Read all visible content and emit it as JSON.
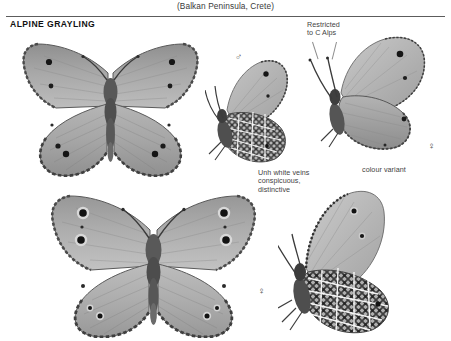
{
  "page": {
    "running_head": "(Balkan Peninsula, Crete)",
    "species_title": "ALPINE GRAYLING"
  },
  "annotations": [
    {
      "id": "restricted",
      "text": "Restricted\nto C Alps"
    },
    {
      "id": "unh_veins",
      "text": "Unh white veins\nconspicuous,\ndistinctive"
    },
    {
      "id": "colour_variant",
      "text": "colour variant"
    }
  ],
  "annotation_lines": {
    "restricted": [
      "Restricted",
      "to C Alps"
    ],
    "unh_veins": [
      "Unh white veins",
      "conspicuous,",
      "distinctive"
    ],
    "colour_variant": [
      "colour variant"
    ]
  },
  "symbols": {
    "male": "♂",
    "female_variant": "♀",
    "female_bottom": "♀"
  },
  "specimens": [
    {
      "id": "male-upperside",
      "sex": "male",
      "view": "upperside",
      "label": "male upperside, wings spread"
    },
    {
      "id": "male-underside",
      "sex": "male",
      "view": "underside",
      "label": "male underside, wings closed"
    },
    {
      "id": "female-variant-underside",
      "sex": "female",
      "view": "underside",
      "label": "colour variant female underside"
    },
    {
      "id": "female-upperside",
      "sex": "female",
      "view": "upperside",
      "label": "female upperside, wings spread"
    },
    {
      "id": "female-underside",
      "sex": "female",
      "view": "underside",
      "label": "female underside, wings closed"
    }
  ],
  "colors": {
    "rule": "#5c5c5c",
    "title": "#111111",
    "annotation_text": "#3f3f3f",
    "wing_light": "#b9b9b9",
    "wing_mid": "#9a9a9a",
    "wing_dark": "#6f6f6f",
    "eyespot": "#1a1a1a",
    "background": "#ffffff"
  }
}
